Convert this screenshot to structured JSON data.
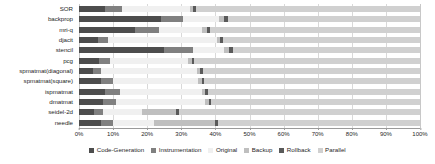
{
  "chart_data": {
    "type": "bar",
    "orientation": "horizontal",
    "stacked": true,
    "normalized_percent": true,
    "title": "",
    "xlabel": "",
    "ylabel": "",
    "xlim": [
      0,
      100
    ],
    "xticks": [
      "0%",
      "10%",
      "20%",
      "30%",
      "40%",
      "50%",
      "60%",
      "70%",
      "80%",
      "90%",
      "100%"
    ],
    "xtick_values": [
      0,
      10,
      20,
      30,
      40,
      50,
      60,
      70,
      80,
      90,
      100
    ],
    "grid": true,
    "legend_position": "bottom",
    "categories": [
      "SOR",
      "backprop",
      "mri-q",
      "djacit",
      "stencil",
      "pcg",
      "spmatmat(diagonal)",
      "spmatmat(square)",
      "ispmatmat",
      "dmatmat",
      "seidel-2d",
      "needle"
    ],
    "series": [
      {
        "name": "Code-Generation",
        "color": "#4d4d4d",
        "values": [
          7.5,
          24.0,
          16.5,
          5.5,
          25.0,
          6.0,
          4.0,
          6.5,
          7.5,
          7.0,
          4.5,
          6.5
        ]
      },
      {
        "name": "Instrumentation",
        "color": "#808080",
        "values": [
          5.0,
          6.5,
          7.0,
          3.0,
          8.5,
          3.0,
          2.5,
          3.5,
          4.5,
          4.0,
          2.5,
          3.5
        ]
      },
      {
        "name": "Original",
        "color": "#f0f0f0",
        "values": [
          20.0,
          10.5,
          12.5,
          32.0,
          9.0,
          23.0,
          28.0,
          25.0,
          24.0,
          26.0,
          11.5,
          12.0
        ]
      },
      {
        "name": "Backup",
        "color": "#bfbfbf",
        "values": [
          1.0,
          1.5,
          1.5,
          1.0,
          1.5,
          1.0,
          1.0,
          1.0,
          1.0,
          1.0,
          10.0,
          18.0
        ]
      },
      {
        "name": "Rollback",
        "color": "#5a5a5a",
        "values": [
          0.8,
          1.2,
          1.0,
          0.8,
          1.2,
          0.8,
          0.8,
          0.8,
          0.8,
          0.8,
          0.8,
          0.8
        ]
      },
      {
        "name": "Parallel",
        "color": "#d0d0d0",
        "values": [
          65.7,
          56.3,
          61.5,
          57.7,
          54.8,
          66.2,
          63.7,
          63.2,
          62.2,
          61.2,
          70.7,
          59.2
        ]
      }
    ]
  },
  "legend": {
    "items": [
      {
        "label": "Code-Generation",
        "color": "#4d4d4d"
      },
      {
        "label": "Instrumentation",
        "color": "#808080"
      },
      {
        "label": "Original",
        "color": "#f0f0f0"
      },
      {
        "label": "Backup",
        "color": "#bfbfbf"
      },
      {
        "label": "Rollback",
        "color": "#5a5a5a"
      },
      {
        "label": "Parallel",
        "color": "#d0d0d0"
      }
    ]
  }
}
